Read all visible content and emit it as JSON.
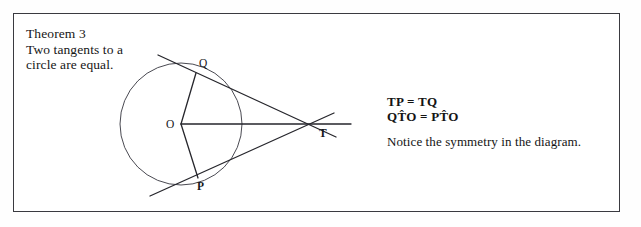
{
  "page": {
    "background_color": "#fefefe",
    "frame_color": "#3a3a40"
  },
  "theorem": {
    "title": "Theorem 3",
    "statement_line_1": "Two tangents to a",
    "statement_line_2": "circle are equal.",
    "full_text": "Theorem 3\nTwo tangents to a\ncircle are equal."
  },
  "results": {
    "equation_1": "TP = TQ",
    "equation_2": "QT̂O = PT̂O",
    "note": "Notice the symmetry in the diagram."
  },
  "diagram": {
    "labels": {
      "center": "O",
      "upper_tangent_point": "Q",
      "lower_tangent_point": "P",
      "external_point": "T"
    },
    "geometry": {
      "circle_center_x": 181,
      "circle_center_y": 124,
      "circle_radius": 61,
      "point_Q_x": 196,
      "point_Q_y": 73,
      "point_P_x": 198,
      "point_P_y": 178,
      "point_T_x": 320,
      "point_T_y": 124,
      "upper_tangent_start_x": 158,
      "upper_tangent_start_y": 55,
      "upper_tangent_end_x": 336,
      "upper_tangent_end_y": 137,
      "lower_tangent_start_x": 150,
      "lower_tangent_start_y": 196,
      "lower_tangent_end_x": 334,
      "lower_tangent_end_y": 113,
      "axis_line_end_x": 351,
      "stroke_color": "#26262c",
      "circle_stroke_color": "#4a4a52"
    }
  }
}
